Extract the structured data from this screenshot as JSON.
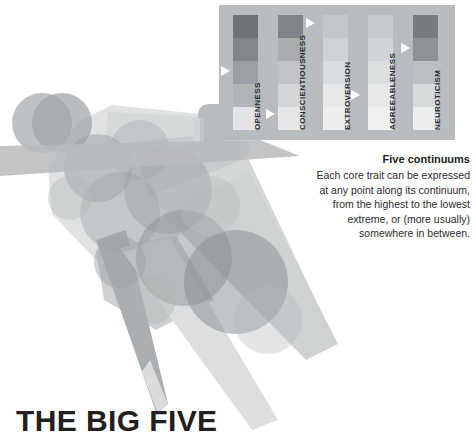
{
  "title": "THE BIG FIVE",
  "caption": {
    "heading": "Five continuums",
    "line1": "Each core trait can be expressed",
    "line2": "at any point along its continuum,",
    "line3": "from the highest to the lowest",
    "line4": "extreme, or (more usually)",
    "line5": "somewhere in between."
  },
  "panel": {
    "background_color": "#b9bcbe",
    "marker_color": "#ffffff",
    "columns": [
      {
        "label": "OPENNESS",
        "x": 14,
        "segment_colors": [
          "#6f7376",
          "#828689",
          "#9aa0a3",
          "#b0b5b7",
          "#e2e4e5"
        ],
        "marker_level": 3,
        "marker_side": "left",
        "marker_y": 66
      },
      {
        "label": "CONSCIENTIOUSNESS",
        "x": 59,
        "segment_colors": [
          "#7f8488",
          "#a7acaf",
          "#c0c4c6",
          "#d3d6d7",
          "#e4e6e7"
        ],
        "marker_level": 1,
        "marker_side": "right",
        "marker_y": 18
      },
      {
        "label": "EXTROVERSION",
        "x": 104,
        "segment_colors": [
          "#c3c7c9",
          "#cfd2d4",
          "#dadddf",
          "#e6e8e9",
          "#edeeef"
        ],
        "marker_level": 4,
        "marker_side": "right",
        "marker_y": 90
      },
      {
        "label": "AGREEABLENESS",
        "x": 149,
        "segment_colors": [
          "#c6cacc",
          "#d2d5d7",
          "#dcdfe0",
          "#e6e8e9",
          "#eff0f0"
        ],
        "marker_level": 1,
        "marker_side": "left",
        "marker_y": 20
      },
      {
        "label": "NEUROTICISM",
        "x": 194,
        "segment_colors": [
          "#777c7f",
          "#8d9295",
          "#bcc0c2",
          "#d7dadb",
          "#eceded"
        ],
        "marker_level": 2,
        "marker_side": "left",
        "marker_y": 42
      }
    ]
  },
  "figure": {
    "alt": "abstract human figure composed of overlapping translucent circles and tapering limb shapes",
    "tone_light": "#e9eaeb",
    "tone_mid": "#c6c9cb",
    "tone_dark": "#9a9fa2"
  }
}
